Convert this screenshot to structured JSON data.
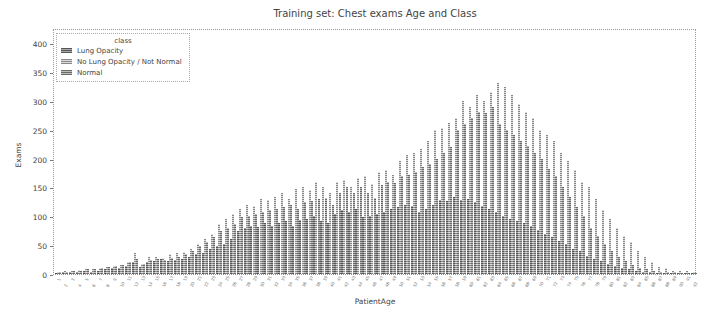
{
  "chart_data": {
    "type": "bar",
    "title": "Training set: Chest exams Age and Class",
    "xlabel": "PatientAge",
    "ylabel": "Exams",
    "ylim": [
      0,
      410
    ],
    "yticks": [
      0,
      50,
      100,
      150,
      200,
      250,
      300,
      350,
      400
    ],
    "grid": false,
    "legend": {
      "title": "class",
      "position": "upper left",
      "entries": [
        "Lung Opacity",
        "No Lung Opacity / Not Normal",
        "Normal"
      ]
    },
    "categories": [
      1,
      2,
      3,
      4,
      5,
      6,
      7,
      8,
      9,
      10,
      11,
      12,
      13,
      14,
      15,
      16,
      17,
      18,
      19,
      20,
      21,
      22,
      23,
      24,
      25,
      26,
      27,
      28,
      29,
      30,
      31,
      32,
      33,
      34,
      35,
      36,
      37,
      38,
      39,
      40,
      41,
      42,
      43,
      44,
      45,
      46,
      47,
      48,
      49,
      50,
      51,
      52,
      53,
      54,
      55,
      56,
      57,
      58,
      59,
      60,
      61,
      62,
      63,
      64,
      65,
      66,
      67,
      68,
      69,
      70,
      71,
      72,
      73,
      74,
      75,
      76,
      77,
      78,
      79,
      80,
      81,
      82,
      83,
      84,
      85,
      86,
      87,
      88,
      89,
      90,
      91,
      92
    ],
    "series": [
      {
        "name": "Lung Opacity",
        "values": [
          2,
          3,
          4,
          4,
          5,
          4,
          6,
          8,
          10,
          10,
          14,
          20,
          12,
          20,
          22,
          26,
          22,
          24,
          26,
          30,
          34,
          36,
          44,
          48,
          52,
          60,
          74,
          80,
          84,
          82,
          88,
          84,
          88,
          92,
          84,
          94,
          96,
          100,
          92,
          88,
          104,
          110,
          108,
          112,
          98,
          100,
          104,
          108,
          112,
          116,
          120,
          118,
          108,
          112,
          120,
          128,
          126,
          134,
          128,
          130,
          124,
          118,
          112,
          108,
          100,
          96,
          92,
          88,
          84,
          76,
          70,
          64,
          58,
          52,
          44,
          40,
          32,
          26,
          22,
          18,
          14,
          10,
          8,
          5,
          4,
          3,
          2,
          2,
          1,
          1,
          1,
          1
        ]
      },
      {
        "name": "No Lung Opacity / Not Normal",
        "values": [
          4,
          5,
          6,
          7,
          8,
          8,
          10,
          12,
          14,
          16,
          20,
          36,
          18,
          30,
          30,
          28,
          34,
          36,
          38,
          44,
          52,
          60,
          70,
          86,
          96,
          104,
          112,
          120,
          118,
          130,
          128,
          134,
          140,
          130,
          148,
          150,
          146,
          160,
          150,
          140,
          160,
          162,
          150,
          166,
          170,
          156,
          176,
          180,
          172,
          196,
          206,
          210,
          216,
          230,
          250,
          252,
          262,
          270,
          300,
          290,
          310,
          300,
          316,
          330,
          324,
          310,
          294,
          280,
          270,
          250,
          240,
          230,
          210,
          196,
          180,
          160,
          150,
          130,
          110,
          96,
          80,
          66,
          56,
          40,
          30,
          20,
          12,
          10,
          6,
          6,
          5,
          4
        ]
      },
      {
        "name": "Normal",
        "values": [
          3,
          4,
          5,
          6,
          8,
          8,
          10,
          12,
          14,
          16,
          20,
          26,
          18,
          24,
          26,
          24,
          28,
          30,
          34,
          40,
          48,
          56,
          64,
          74,
          80,
          86,
          98,
          100,
          104,
          108,
          110,
          112,
          116,
          120,
          112,
          124,
          126,
          130,
          132,
          120,
          140,
          150,
          140,
          150,
          140,
          132,
          154,
          160,
          158,
          170,
          172,
          176,
          186,
          190,
          200,
          210,
          220,
          250,
          260,
          270,
          280,
          278,
          290,
          260,
          250,
          240,
          230,
          222,
          210,
          200,
          182,
          170,
          150,
          134,
          116,
          100,
          80,
          66,
          52,
          40,
          30,
          22,
          16,
          10,
          8,
          6,
          4,
          4,
          3,
          2,
          2,
          2
        ]
      }
    ]
  },
  "title": "Training set: Chest exams Age and Class",
  "xlabel": "PatientAge",
  "ylabel": "Exams",
  "legend": {
    "title": "class",
    "items": [
      "Lung Opacity",
      "No Lung Opacity / Not Normal",
      "Normal"
    ]
  }
}
